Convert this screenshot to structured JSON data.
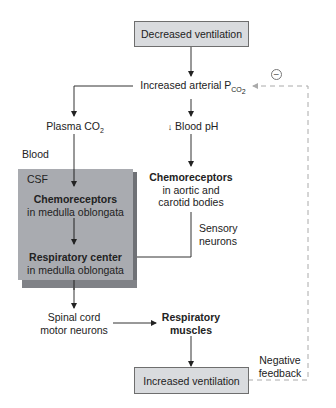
{
  "nodes": {
    "decreased_ventilation": "Decreased ventilation",
    "increased_pco2_prefix": "Increased arterial P",
    "increased_pco2_sub": "CO",
    "increased_pco2_sub2": "2",
    "plasma_co2_prefix": "Plasma CO",
    "plasma_co2_sub": "2",
    "blood_ph_arrow": "↓",
    "blood_ph": "Blood pH",
    "blood_label": "Blood",
    "csf_label": "CSF",
    "central_chemo_title": "Chemoreceptors",
    "central_chemo_sub": "in medulla oblongata",
    "peripheral_chemo_title": "Chemoreceptors",
    "peripheral_chemo_line1": "in aortic and",
    "peripheral_chemo_line2": "carotid bodies",
    "sensory_line1": "Sensory",
    "sensory_line2": "neurons",
    "resp_center_title": "Respiratory center",
    "resp_center_sub": "in medulla oblongata",
    "spinal_line1": "Spinal cord",
    "spinal_line2": "motor neurons",
    "resp_muscles_line1": "Respiratory",
    "resp_muscles_line2": "muscles",
    "increased_ventilation": "Increased ventilation",
    "neg_feedback_line1": "Negative",
    "neg_feedback_line2": "feedback",
    "minus_symbol": "−"
  },
  "colors": {
    "box_fill": "#d9dbde",
    "csf_fill": "#a9abb0",
    "line": "#333333",
    "dashed": "#aaaaaa"
  }
}
